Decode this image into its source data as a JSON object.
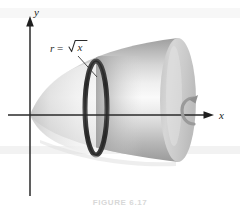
{
  "figure": {
    "caption": "FIGURE 6.17",
    "background_color": "#ffffff",
    "axis_color": "#2a2a2a",
    "solid_fill_light": "#f2f2f2",
    "solid_fill_mid": "#cfcfcf",
    "solid_fill_dark": "#a8a8a8",
    "ring_color": "#3a3a3a",
    "band_color": "#f0f0f0"
  },
  "axes": {
    "y_label": "y",
    "x_label": "x",
    "origin": {
      "x": 30,
      "y": 115
    },
    "y_axis": {
      "top": 18,
      "bottom": 196
    },
    "x_axis": {
      "left": 8,
      "right": 214
    }
  },
  "annotations": {
    "curve_label_r": "r",
    "curve_label_equals": "=",
    "curve_label_radicand": "x",
    "curve_label_full": "r = √x",
    "rotation_icon": "rotation-arrow",
    "leader_line": {
      "from_x": 78,
      "from_y": 56,
      "to_x": 98,
      "to_y": 76
    }
  },
  "solid": {
    "name": "paraboloid-of-revolution",
    "vertex": {
      "x": 30,
      "y": 115
    },
    "end_cap": {
      "cx": 178,
      "cy": 100,
      "rx": 18,
      "ry": 62
    },
    "disk_ring": {
      "cx": 96,
      "cy": 108,
      "rx": 11,
      "ry": 47
    }
  }
}
